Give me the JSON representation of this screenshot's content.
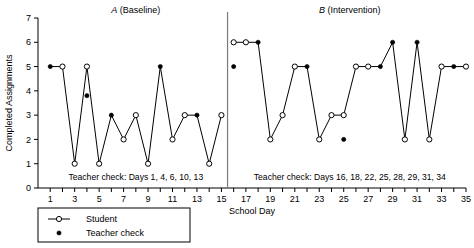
{
  "chart_data": {
    "type": "line",
    "title": "",
    "xlabel": "School Day",
    "ylabel": "Completed Assignments",
    "xlim": [
      0,
      35
    ],
    "ylim": [
      0,
      7
    ],
    "grid": false,
    "x_ticks": [
      1,
      2,
      3,
      4,
      5,
      6,
      7,
      8,
      9,
      10,
      11,
      12,
      13,
      14,
      15,
      16,
      17,
      18,
      19,
      20,
      21,
      22,
      23,
      24,
      25,
      26,
      27,
      28,
      29,
      30,
      31,
      32,
      33,
      34,
      35
    ],
    "x_tick_labels": [
      "1",
      "",
      "3",
      "",
      "5",
      "",
      "7",
      "",
      "9",
      "",
      "11",
      "",
      "13",
      "",
      "15",
      "",
      "17",
      "",
      "19",
      "",
      "21",
      "",
      "23",
      "",
      "25",
      "",
      "27",
      "",
      "29",
      "",
      "31",
      "",
      "33",
      "",
      "35"
    ],
    "y_ticks": [
      0,
      1,
      2,
      3,
      4,
      5,
      6,
      7
    ],
    "y_tick_labels": [
      "0",
      "1",
      "2",
      "3",
      "4",
      "5",
      "6",
      "7"
    ],
    "phases": [
      {
        "id": "A",
        "letter": "A",
        "name": "(Baseline)",
        "title": "A (Baseline)",
        "x_start": 1,
        "x_end": 15,
        "annotation": "Teacher check: Days 1, 4, 6, 10, 13",
        "x": [
          1,
          2,
          3,
          4,
          5,
          6,
          7,
          8,
          9,
          10,
          11,
          12,
          13,
          14,
          15
        ],
        "values": [
          5,
          5,
          1,
          5,
          1,
          3,
          2,
          3,
          1,
          5,
          2,
          3,
          3,
          1,
          3
        ],
        "teacher_check_days": [
          1,
          4,
          6,
          10,
          13
        ],
        "teacher_check_values": [
          5,
          3.8,
          3,
          5,
          3
        ]
      },
      {
        "id": "B",
        "letter": "B",
        "name": "(Intervention)",
        "title": "B (Intervention)",
        "x_start": 16,
        "x_end": 35,
        "annotation": "Teacher check: Days 16, 18, 22, 25, 28, 29, 31, 34",
        "x": [
          16,
          17,
          18,
          19,
          20,
          21,
          22,
          23,
          24,
          25,
          26,
          27,
          28,
          29,
          30,
          31,
          32,
          33,
          34,
          35
        ],
        "values": [
          6,
          6,
          6,
          2,
          3,
          5,
          5,
          2,
          3,
          3,
          5,
          5,
          5,
          6,
          2,
          6,
          2,
          5,
          5,
          5
        ],
        "teacher_check_days": [
          16,
          18,
          22,
          25,
          28,
          29,
          31,
          34
        ],
        "teacher_check_values": [
          5,
          6,
          5,
          2,
          5,
          6,
          6,
          5
        ]
      }
    ],
    "series": [
      {
        "name": "Student",
        "marker": "open-circle",
        "color": "#000000"
      },
      {
        "name": "Teacher check",
        "marker": "filled-circle",
        "color": "#000000"
      }
    ],
    "legend": {
      "position": "bottom-left",
      "entries": [
        {
          "label": "Student",
          "marker": "open-circle-line"
        },
        {
          "label": "Teacher check",
          "marker": "filled-circle"
        }
      ]
    },
    "divider_x": 15.5
  }
}
